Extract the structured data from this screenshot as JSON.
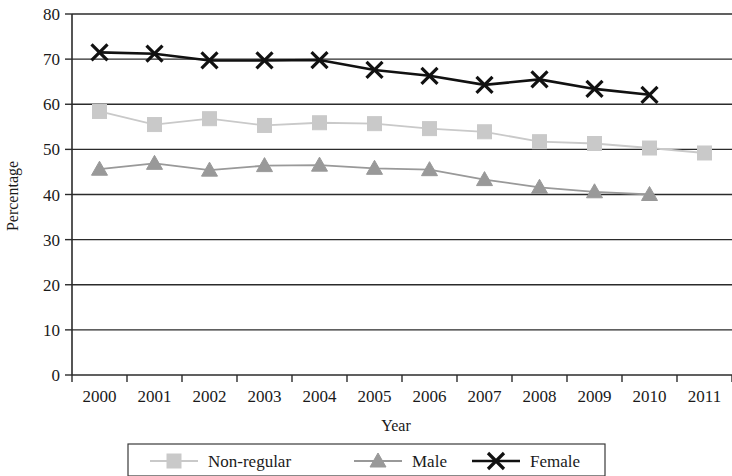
{
  "chart_data": {
    "type": "line",
    "title": "",
    "xlabel": "Year",
    "ylabel": "Percentage",
    "categories": [
      "2000",
      "2001",
      "2002",
      "2003",
      "2004",
      "2005",
      "2006",
      "2007",
      "2008",
      "2009",
      "2010",
      "2011"
    ],
    "x": [
      2000,
      2001,
      2002,
      2003,
      2004,
      2005,
      2006,
      2007,
      2008,
      2009,
      2010,
      2011
    ],
    "ylim": [
      0,
      80
    ],
    "yticks": [
      0,
      10,
      20,
      30,
      40,
      50,
      60,
      70,
      80
    ],
    "ytick_labels": [
      "0",
      "10",
      "20",
      "30",
      "40",
      "50",
      "60",
      "70",
      "80"
    ],
    "grid": true,
    "legend_position": "bottom",
    "series": [
      {
        "name": "Non-regular",
        "color": "#c9c9c9",
        "marker": "square",
        "values": [
          58.4,
          55.5,
          56.8,
          55.3,
          55.9,
          55.7,
          54.6,
          53.9,
          51.7,
          51.3,
          50.3,
          49.2
        ]
      },
      {
        "name": "Male",
        "color": "#999999",
        "marker": "triangle",
        "values": [
          45.6,
          46.9,
          45.4,
          46.4,
          46.5,
          45.8,
          45.5,
          43.3,
          41.6,
          40.6,
          40.0,
          null
        ]
      },
      {
        "name": "Female",
        "color": "#111111",
        "marker": "x",
        "values": [
          71.5,
          71.2,
          69.7,
          69.7,
          69.8,
          67.6,
          66.3,
          64.3,
          65.5,
          63.4,
          62.1,
          null
        ]
      }
    ]
  },
  "axes": {
    "y_title": "Percentage",
    "x_title": "Year"
  },
  "legend": {
    "items": [
      {
        "label": "Non-regular",
        "marker": "square-marker",
        "color": "#c9c9c9"
      },
      {
        "label": "Male",
        "marker": "triangle-marker",
        "color": "#999999"
      },
      {
        "label": "Female",
        "marker": "x-marker",
        "color": "#111111"
      }
    ]
  }
}
